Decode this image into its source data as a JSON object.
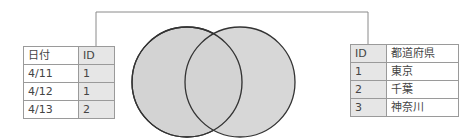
{
  "left_table": {
    "headers": [
      "日付",
      "ID"
    ],
    "rows": [
      [
        "4/11",
        "1"
      ],
      [
        "4/12",
        "1"
      ],
      [
        "4/13",
        "2"
      ]
    ]
  },
  "right_table": {
    "headers": [
      "ID",
      "都道府県"
    ],
    "rows": [
      [
        "1",
        "東京"
      ],
      [
        "2",
        "千葉"
      ],
      [
        "3",
        "神奈川"
      ]
    ]
  },
  "venn": {
    "fill_color": "#d3d3d3",
    "stroke_color": "#333333"
  },
  "connector": {
    "color": "#888888"
  }
}
